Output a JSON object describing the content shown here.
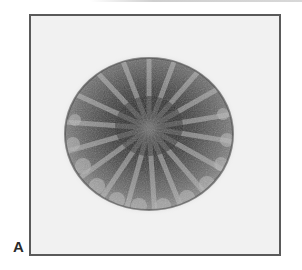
{
  "figure": {
    "panel_label": "A",
    "colors": {
      "background": "#f1f1f1",
      "frame": "#5a5a5a",
      "cluster_dark": "#2e2e2e",
      "cluster_mid": "#6b6b6b",
      "cluster_light": "#a8a8a8"
    }
  }
}
